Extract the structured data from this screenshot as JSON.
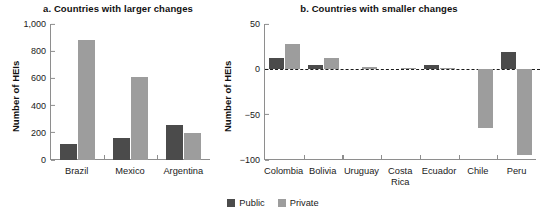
{
  "figure": {
    "legend": {
      "items": [
        {
          "label": "Public",
          "color": "#4b4b4b",
          "key": "public"
        },
        {
          "label": "Private",
          "color": "#9d9d9d",
          "key": "private"
        }
      ]
    }
  },
  "chart_data": [
    {
      "id": "panel-a",
      "type": "bar",
      "title": "a.  Countries with larger changes",
      "xlabel": "",
      "ylabel": "Number of HEIs",
      "ylim": [
        0,
        1000
      ],
      "yticks": [
        0,
        200,
        400,
        600,
        800,
        1000
      ],
      "ytick_labels": [
        "0",
        "200",
        "400",
        "600",
        "800",
        "1,000"
      ],
      "grid": false,
      "legend_position": "bottom-center",
      "categories": [
        "Brazil",
        "Mexico",
        "Argentina"
      ],
      "series": [
        {
          "name": "Public",
          "color": "#4b4b4b",
          "values": [
            118,
            163,
            258
          ]
        },
        {
          "name": "Private",
          "color": "#9d9d9d",
          "values": [
            880,
            608,
            200
          ]
        }
      ]
    },
    {
      "id": "panel-b",
      "type": "bar",
      "title": "b. Countries with smaller changes",
      "xlabel": "",
      "ylabel": "Number of HEIs",
      "ylim": [
        -100,
        50
      ],
      "yticks": [
        50,
        0,
        -50,
        -100
      ],
      "ytick_labels": [
        "50",
        "0",
        "−50",
        "−100"
      ],
      "grid": false,
      "zero_line": true,
      "legend_position": "bottom-center",
      "categories": [
        "Colombia",
        "Bolivia",
        "Uruguay",
        "Costa\nRica",
        "Ecuador",
        "Chile",
        "Peru"
      ],
      "series": [
        {
          "name": "Public",
          "color": "#4b4b4b",
          "values": [
            13,
            5,
            0,
            0,
            5,
            0,
            19
          ]
        },
        {
          "name": "Private",
          "color": "#9d9d9d",
          "values": [
            28,
            12,
            3,
            2,
            1,
            -65,
            -95
          ]
        }
      ]
    }
  ]
}
